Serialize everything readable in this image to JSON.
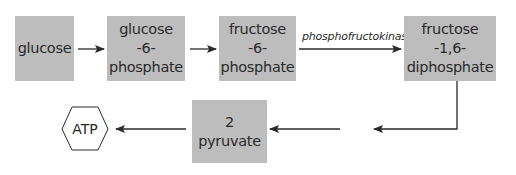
{
  "diagram": {
    "title": "",
    "colors": {
      "box_fill": "#bdbdbd",
      "line": "#2a2a2a",
      "background": "#ffffff"
    },
    "nodes": [
      {
        "id": "glucose",
        "shape": "rect",
        "lines": [
          "glucose"
        ]
      },
      {
        "id": "g6p",
        "shape": "rect",
        "lines": [
          "glucose",
          "-6-",
          "phosphate"
        ]
      },
      {
        "id": "f6p",
        "shape": "rect",
        "lines": [
          "fructose",
          "-6-",
          "phosphate"
        ]
      },
      {
        "id": "f16dp",
        "shape": "rect",
        "lines": [
          "fructose",
          "-1,6-",
          "diphosphate"
        ]
      },
      {
        "id": "pyruvate",
        "shape": "rect",
        "lines": [
          "2 pyruvate"
        ]
      },
      {
        "id": "atp",
        "shape": "hexagon",
        "lines": [
          "ATP"
        ]
      }
    ],
    "edges": [
      {
        "from": "glucose",
        "to": "g6p",
        "label": ""
      },
      {
        "from": "g6p",
        "to": "f6p",
        "label": ""
      },
      {
        "from": "f6p",
        "to": "f16dp",
        "label": "phosphofructokinase"
      },
      {
        "from": "f16dp",
        "to": "pyruvate",
        "label": "",
        "note": "elbow path with gap"
      },
      {
        "from": "pyruvate",
        "to": "atp",
        "label": ""
      }
    ]
  }
}
